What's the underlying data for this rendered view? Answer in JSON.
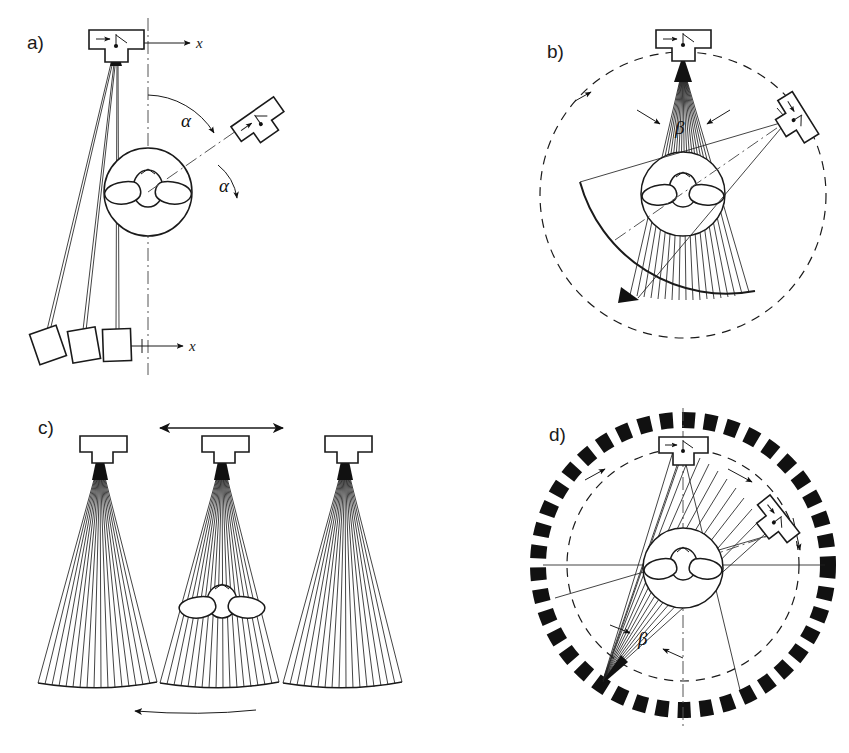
{
  "figure": {
    "background_color": "#ffffff",
    "line_color": "#1a1a1a"
  },
  "panels": [
    {
      "id": "a",
      "label": "a)",
      "title": "Translate-rotate single detector geometry",
      "axis_labels": [
        "x",
        "x"
      ],
      "angle_symbols": [
        "α",
        "α"
      ],
      "source_count": 1,
      "detector_count": 3,
      "ray_count": 3,
      "has_rotating_source": true,
      "has_center_object": true
    },
    {
      "id": "b",
      "label": "b)",
      "title": "Rotating fan beam with rotating curved detector array",
      "axis_labels": [],
      "angle_symbols": [
        "β"
      ],
      "source_count": 2,
      "detector_count": 1,
      "ray_count": 21,
      "has_rotating_source": true,
      "has_center_object": true
    },
    {
      "id": "c",
      "label": "c)",
      "title": "Translating fan beam at three positions",
      "axis_labels": [],
      "angle_symbols": [],
      "source_count": 3,
      "detector_count": 3,
      "ray_count": 19,
      "has_rotating_source": false,
      "has_center_object": true
    },
    {
      "id": "d",
      "label": "d)",
      "title": "Rotating source with stationary full detector ring",
      "axis_labels": [],
      "angle_symbols": [
        "β"
      ],
      "source_count": 2,
      "detector_count": 44,
      "ray_count": 13,
      "has_rotating_source": true,
      "has_center_object": true
    }
  ],
  "symbols": {
    "alpha": "α",
    "beta": "β",
    "x_axis": "x"
  }
}
